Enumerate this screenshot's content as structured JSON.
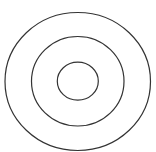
{
  "diagram": {
    "type": "concentric-circles",
    "background": "#ffffff",
    "stroke_color": "#333333",
    "stroke_width": 1.2,
    "circles": [
      {
        "name": "outer-ring",
        "cx": 77.75,
        "cy": 81.5,
        "rx": 72.75,
        "ry": 69
      },
      {
        "name": "middle-ring",
        "cx": 77.75,
        "cy": 81.25,
        "rx": 46.25,
        "ry": 44.75
      },
      {
        "name": "inner-ring",
        "cx": 77.8,
        "cy": 81.2,
        "rx": 20.5,
        "ry": 19
      }
    ]
  }
}
